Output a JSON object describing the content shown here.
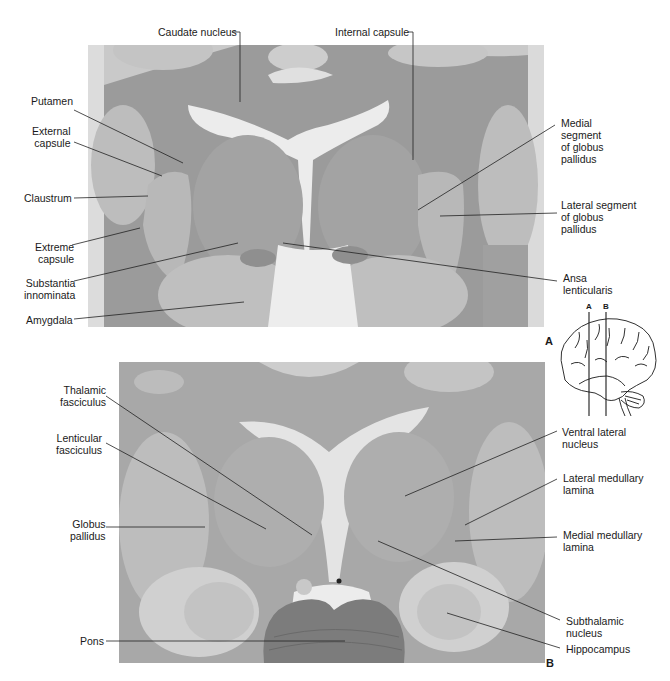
{
  "figure": {
    "panels": [
      {
        "id": "A",
        "letter": "A",
        "description": "Coronal section through basal ganglia and internal capsule"
      },
      {
        "id": "B",
        "letter": "B",
        "description": "Coronal section through thalamus, subthalamic nucleus and pons"
      }
    ],
    "inset": {
      "description": "Lateral view of brain showing section planes",
      "plane_labels": [
        "A",
        "B"
      ]
    },
    "colors": {
      "tissue_dark": "#8c8c8c",
      "tissue_mid": "#a9a9a9",
      "tissue_light": "#c4c4c4",
      "white_matter": "#e6e6e6",
      "background": "#ffffff",
      "leader_line": "#222222"
    }
  },
  "panel_a": {
    "labels": {
      "caudate_nucleus": "Caudate nucleus",
      "internal_capsule": "Internal capsule",
      "putamen": "Putamen",
      "external_capsule": "External\ncapsule",
      "claustrum": "Claustrum",
      "extreme_capsule": "Extreme\ncapsule",
      "substantia_innominata": "Substantia\ninnominata",
      "amygdala": "Amygdala",
      "medial_segment_gp": "Medial\nsegment\nof globus\npallidus",
      "lateral_segment_gp": "Lateral segment\nof globus\npallidus",
      "ansa_lenticularis": "Ansa\nlenticularis"
    }
  },
  "panel_b": {
    "labels": {
      "thalamic_fasciculus": "Thalamic\nfasciculus",
      "lenticular_fasciculus": "Lenticular\nfasciculus",
      "globus_pallidus": "Globus\npallidus",
      "pons": "Pons",
      "ventral_lateral_nucleus": "Ventral lateral\nnucleus",
      "lateral_medullary_lamina": "Lateral medullary\nlamina",
      "medial_medullary_lamina": "Medial medullary\nlamina",
      "subthalamic_nucleus": "Subthalamic\nnucleus",
      "hippocampus": "Hippocampus"
    }
  }
}
